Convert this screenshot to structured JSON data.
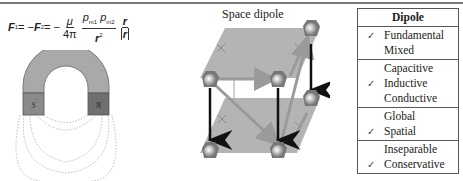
{
  "formula": {
    "lhs1": "F",
    "lhs1_sub": "1",
    "eq1": " = −",
    "lhs2": "F",
    "lhs2_sub": "2",
    "eq2": " = −",
    "frac1_num": "μ",
    "frac1_den": "4π",
    "frac2_num_p1": "p",
    "frac2_num_p1_sub": "m1",
    "frac2_num_p2": "p",
    "frac2_num_p2_sub": "m2",
    "frac2_den": "r",
    "frac2_den_sup": "2",
    "frac3_num": "r",
    "frac3_den": "r"
  },
  "magnet": {
    "south_label": "S",
    "north_label": "N",
    "body_color": "#a9a9a9",
    "pole_color": "#7d7d7d"
  },
  "cube": {
    "title": "Space dipole",
    "plane_color": "#b4b4b4",
    "arrow_color": "#9a9a9a",
    "vertical_arrow_color": "#111111"
  },
  "table": {
    "header": "Dipole",
    "groups": [
      {
        "rows": [
          {
            "check": "✓",
            "label": "Fundamental"
          },
          {
            "check": "",
            "label": "Mixed"
          }
        ]
      },
      {
        "rows": [
          {
            "check": "",
            "label": "Capacitive"
          },
          {
            "check": "✓",
            "label": "Inductive"
          },
          {
            "check": "",
            "label": "Conductive"
          }
        ]
      },
      {
        "rows": [
          {
            "check": "",
            "label": "Global"
          },
          {
            "check": "✓",
            "label": "Spatial"
          }
        ]
      },
      {
        "rows": [
          {
            "check": "",
            "label": "Inseparable"
          },
          {
            "check": "✓",
            "label": "Conservative"
          }
        ]
      }
    ]
  }
}
